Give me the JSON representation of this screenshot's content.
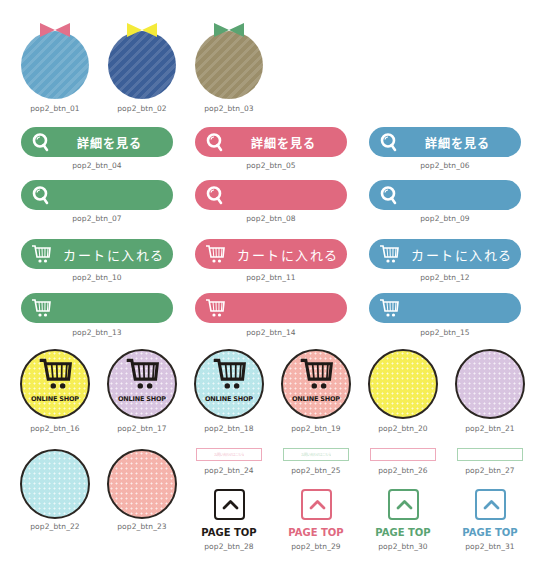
{
  "colors": {
    "green": "#5aa472",
    "pink": "#e0697f",
    "blue": "#5b9fc3",
    "dark": "#1f1a17",
    "yellow": "#f6ee55",
    "lavender": "#d8c4e0",
    "aqua": "#b9e6ea",
    "salmon": "#f5b3ab"
  },
  "bow_buttons": [
    {
      "id": "pop2_btn_01",
      "ball": "#66a6c9",
      "bow": "#e2708a"
    },
    {
      "id": "pop2_btn_02",
      "ball": "#3c5f98",
      "bow": "#f4ea3a"
    },
    {
      "id": "pop2_btn_03",
      "ball": "#9b8e6a",
      "bow": "#5aa472"
    }
  ],
  "detail_buttons": {
    "label": "詳細を見る",
    "items": [
      {
        "id": "pop2_btn_04",
        "color": "#5aa472"
      },
      {
        "id": "pop2_btn_05",
        "color": "#e0697f"
      },
      {
        "id": "pop2_btn_06",
        "color": "#5b9fc3"
      }
    ]
  },
  "search_icon_buttons": [
    {
      "id": "pop2_btn_07",
      "color": "#5aa472"
    },
    {
      "id": "pop2_btn_08",
      "color": "#e0697f"
    },
    {
      "id": "pop2_btn_09",
      "color": "#5b9fc3"
    }
  ],
  "cart_buttons": {
    "label": "カートに入れる",
    "items": [
      {
        "id": "pop2_btn_10",
        "color": "#5aa472"
      },
      {
        "id": "pop2_btn_11",
        "color": "#e0697f"
      },
      {
        "id": "pop2_btn_12",
        "color": "#5b9fc3"
      }
    ]
  },
  "cart_icon_buttons": [
    {
      "id": "pop2_btn_13",
      "color": "#5aa472"
    },
    {
      "id": "pop2_btn_14",
      "color": "#e0697f"
    },
    {
      "id": "pop2_btn_15",
      "color": "#5b9fc3"
    }
  ],
  "online_shop": {
    "label": "ONLINE SHOP",
    "items": [
      {
        "id": "pop2_btn_16",
        "color": "#f6ee55"
      },
      {
        "id": "pop2_btn_17",
        "color": "#d8c4e0"
      },
      {
        "id": "pop2_btn_18",
        "color": "#b9e6ea"
      },
      {
        "id": "pop2_btn_19",
        "color": "#f5b3ab"
      }
    ]
  },
  "plain_circles": [
    {
      "id": "pop2_btn_20",
      "color": "#f6ee55"
    },
    {
      "id": "pop2_btn_21",
      "color": "#d8c4e0"
    },
    {
      "id": "pop2_btn_22",
      "color": "#b9e6ea"
    },
    {
      "id": "pop2_btn_23",
      "color": "#f5b3ab"
    }
  ],
  "outline_buttons": [
    {
      "id": "pop2_btn_24",
      "color": "#eeaabb",
      "text": "お問い合わせはこちら"
    },
    {
      "id": "pop2_btn_25",
      "color": "#a9d4b3",
      "text": "お問い合わせはこちら"
    },
    {
      "id": "pop2_btn_26",
      "color": "#eeaabb",
      "text": ""
    },
    {
      "id": "pop2_btn_27",
      "color": "#a9d4b3",
      "text": ""
    }
  ],
  "page_top": {
    "label": "PAGE TOP",
    "items": [
      {
        "id": "pop2_btn_28",
        "color": "#1f1a17"
      },
      {
        "id": "pop2_btn_29",
        "color": "#e0697f"
      },
      {
        "id": "pop2_btn_30",
        "color": "#5aa472"
      },
      {
        "id": "pop2_btn_31",
        "color": "#5b9fc3"
      }
    ]
  }
}
